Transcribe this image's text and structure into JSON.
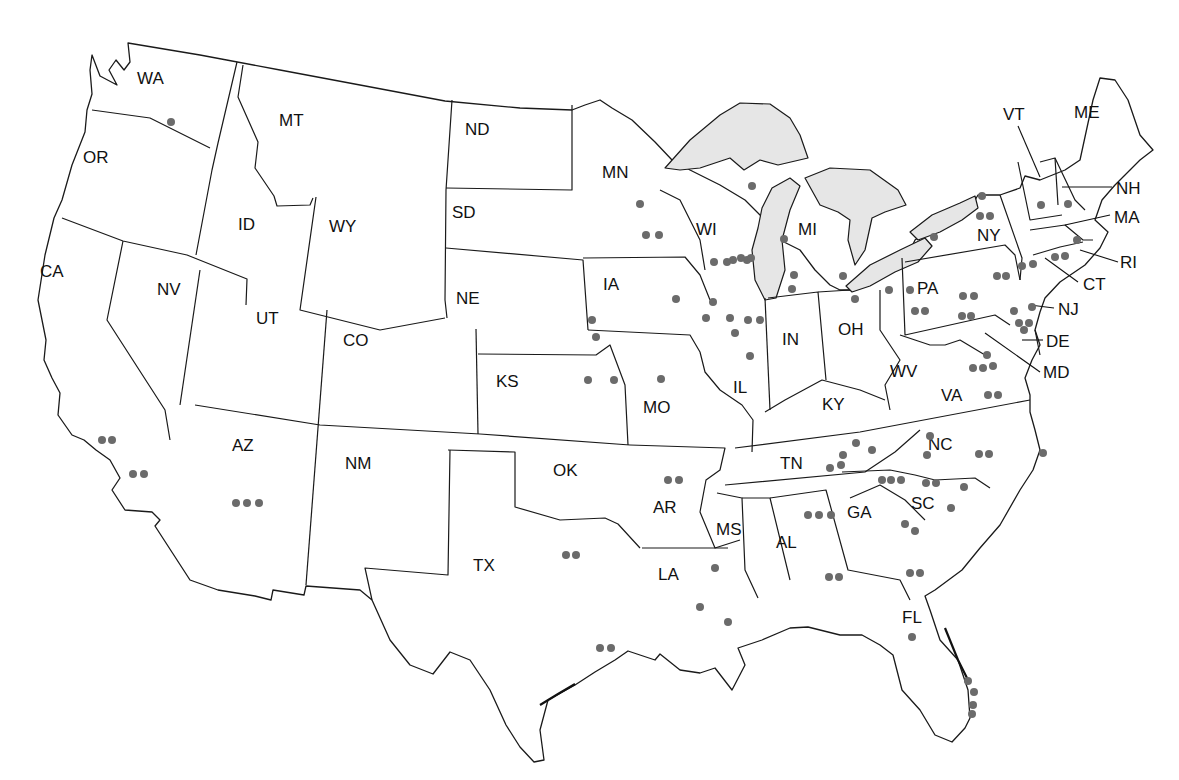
{
  "map": {
    "colors": {
      "dot": "#6b6b6b",
      "lake": "#e6e6e6",
      "border": "#1a1a1a",
      "background": "#ffffff"
    },
    "states": [
      {
        "abbr": "WA",
        "x": 137,
        "y": 84
      },
      {
        "abbr": "OR",
        "x": 83,
        "y": 163
      },
      {
        "abbr": "CA",
        "x": 40,
        "y": 277
      },
      {
        "abbr": "NV",
        "x": 157,
        "y": 295
      },
      {
        "abbr": "ID",
        "x": 238,
        "y": 230
      },
      {
        "abbr": "MT",
        "x": 279,
        "y": 126
      },
      {
        "abbr": "WY",
        "x": 329,
        "y": 232
      },
      {
        "abbr": "UT",
        "x": 256,
        "y": 324
      },
      {
        "abbr": "CO",
        "x": 343,
        "y": 346
      },
      {
        "abbr": "AZ",
        "x": 232,
        "y": 451
      },
      {
        "abbr": "NM",
        "x": 345,
        "y": 469
      },
      {
        "abbr": "ND",
        "x": 465,
        "y": 135
      },
      {
        "abbr": "SD",
        "x": 452,
        "y": 218
      },
      {
        "abbr": "NE",
        "x": 456,
        "y": 304
      },
      {
        "abbr": "KS",
        "x": 496,
        "y": 387
      },
      {
        "abbr": "OK",
        "x": 553,
        "y": 476
      },
      {
        "abbr": "TX",
        "x": 473,
        "y": 571
      },
      {
        "abbr": "MN",
        "x": 602,
        "y": 178
      },
      {
        "abbr": "IA",
        "x": 603,
        "y": 290
      },
      {
        "abbr": "MO",
        "x": 643,
        "y": 413
      },
      {
        "abbr": "AR",
        "x": 653,
        "y": 513
      },
      {
        "abbr": "LA",
        "x": 658,
        "y": 580
      },
      {
        "abbr": "WI",
        "x": 696,
        "y": 235
      },
      {
        "abbr": "IL",
        "x": 733,
        "y": 393
      },
      {
        "abbr": "MI",
        "x": 798,
        "y": 235
      },
      {
        "abbr": "IN",
        "x": 782,
        "y": 345
      },
      {
        "abbr": "OH",
        "x": 838,
        "y": 335
      },
      {
        "abbr": "KY",
        "x": 822,
        "y": 410
      },
      {
        "abbr": "TN",
        "x": 780,
        "y": 469
      },
      {
        "abbr": "MS",
        "x": 716,
        "y": 535
      },
      {
        "abbr": "AL",
        "x": 776,
        "y": 548
      },
      {
        "abbr": "GA",
        "x": 847,
        "y": 518
      },
      {
        "abbr": "FL",
        "x": 902,
        "y": 623
      },
      {
        "abbr": "SC",
        "x": 911,
        "y": 509
      },
      {
        "abbr": "NC",
        "x": 928,
        "y": 450
      },
      {
        "abbr": "VA",
        "x": 941,
        "y": 401
      },
      {
        "abbr": "WV",
        "x": 890,
        "y": 377
      },
      {
        "abbr": "PA",
        "x": 917,
        "y": 294
      },
      {
        "abbr": "NY",
        "x": 977,
        "y": 241
      },
      {
        "abbr": "VT",
        "x": 1003,
        "y": 120
      },
      {
        "abbr": "ME",
        "x": 1074,
        "y": 118
      }
    ],
    "callouts": [
      {
        "abbr": "NH",
        "x": 1116,
        "y": 194,
        "x1": 1062,
        "y1": 187,
        "x2": 1112,
        "y2": 187
      },
      {
        "abbr": "MA",
        "x": 1114,
        "y": 223,
        "x1": 1065,
        "y1": 225,
        "x2": 1110,
        "y2": 215
      },
      {
        "abbr": "RI",
        "x": 1120,
        "y": 268,
        "x1": 1080,
        "y1": 250,
        "x2": 1118,
        "y2": 262
      },
      {
        "abbr": "CT",
        "x": 1083,
        "y": 290,
        "x1": 1045,
        "y1": 258,
        "x2": 1078,
        "y2": 282
      },
      {
        "abbr": "NJ",
        "x": 1058,
        "y": 315,
        "x1": 1030,
        "y1": 305,
        "x2": 1054,
        "y2": 308
      },
      {
        "abbr": "DE",
        "x": 1046,
        "y": 347,
        "x1": 1022,
        "y1": 340,
        "x2": 1043,
        "y2": 340
      },
      {
        "abbr": "MD",
        "x": 1043,
        "y": 378,
        "x1": 985,
        "y1": 333,
        "x2": 1040,
        "y2": 372
      }
    ],
    "callout_vt_leader": {
      "x1": 1018,
      "y1": 126,
      "x2": 1040,
      "y2": 177
    },
    "dots": [
      [
        171,
        122
      ],
      [
        640,
        204
      ],
      [
        646,
        235
      ],
      [
        659,
        235
      ],
      [
        752,
        186
      ],
      [
        733,
        260
      ],
      [
        747,
        260
      ],
      [
        784,
        239
      ],
      [
        714,
        262
      ],
      [
        727,
        262
      ],
      [
        741,
        258
      ],
      [
        751,
        258
      ],
      [
        713,
        302
      ],
      [
        706,
        318
      ],
      [
        730,
        318
      ],
      [
        748,
        320
      ],
      [
        760,
        320
      ],
      [
        735,
        333
      ],
      [
        750,
        356
      ],
      [
        676,
        299
      ],
      [
        592,
        320
      ],
      [
        596,
        337
      ],
      [
        794,
        275
      ],
      [
        792,
        289
      ],
      [
        843,
        276
      ],
      [
        855,
        299
      ],
      [
        889,
        290
      ],
      [
        910,
        290
      ],
      [
        661,
        379
      ],
      [
        614,
        380
      ],
      [
        588,
        380
      ],
      [
        982,
        196
      ],
      [
        980,
        216
      ],
      [
        990,
        216
      ],
      [
        934,
        237
      ],
      [
        1041,
        205
      ],
      [
        1068,
        204
      ],
      [
        1077,
        240
      ],
      [
        1055,
        257
      ],
      [
        1065,
        256
      ],
      [
        1022,
        266
      ],
      [
        1033,
        264
      ],
      [
        997,
        276
      ],
      [
        1006,
        276
      ],
      [
        915,
        311
      ],
      [
        925,
        311
      ],
      [
        963,
        296
      ],
      [
        974,
        296
      ],
      [
        962,
        316
      ],
      [
        971,
        316
      ],
      [
        1032,
        307
      ],
      [
        1019,
        323
      ],
      [
        1029,
        323
      ],
      [
        1024,
        330
      ],
      [
        1014,
        311
      ],
      [
        987,
        355
      ],
      [
        993,
        366
      ],
      [
        973,
        368
      ],
      [
        983,
        368
      ],
      [
        988,
        395
      ],
      [
        998,
        395
      ],
      [
        856,
        443
      ],
      [
        872,
        450
      ],
      [
        930,
        436
      ],
      [
        927,
        455
      ],
      [
        979,
        454
      ],
      [
        989,
        454
      ],
      [
        1043,
        453
      ],
      [
        843,
        455
      ],
      [
        830,
        468
      ],
      [
        841,
        465
      ],
      [
        882,
        480
      ],
      [
        891,
        480
      ],
      [
        901,
        480
      ],
      [
        926,
        483
      ],
      [
        936,
        483
      ],
      [
        964,
        487
      ],
      [
        951,
        508
      ],
      [
        905,
        524
      ],
      [
        915,
        531
      ],
      [
        910,
        573
      ],
      [
        920,
        573
      ],
      [
        808,
        515
      ],
      [
        819,
        515
      ],
      [
        831,
        515
      ],
      [
        829,
        577
      ],
      [
        839,
        577
      ],
      [
        668,
        480
      ],
      [
        679,
        480
      ],
      [
        715,
        568
      ],
      [
        700,
        607
      ],
      [
        728,
        622
      ],
      [
        600,
        648
      ],
      [
        611,
        648
      ],
      [
        566,
        555
      ],
      [
        576,
        555
      ],
      [
        102,
        440
      ],
      [
        112,
        440
      ],
      [
        133,
        474
      ],
      [
        144,
        474
      ],
      [
        236,
        503
      ],
      [
        247,
        503
      ],
      [
        259,
        503
      ],
      [
        912,
        637
      ],
      [
        968,
        681
      ],
      [
        974,
        692
      ],
      [
        973,
        705
      ],
      [
        972,
        714
      ]
    ]
  }
}
